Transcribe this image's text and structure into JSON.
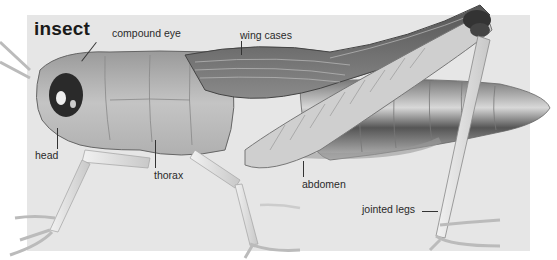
{
  "diagram": {
    "title": "insect",
    "labels": [
      {
        "id": "compound-eye",
        "text": "compound eye"
      },
      {
        "id": "wing-cases",
        "text": "wing cases"
      },
      {
        "id": "head",
        "text": "head"
      },
      {
        "id": "thorax",
        "text": "thorax"
      },
      {
        "id": "abdomen",
        "text": "abdomen"
      },
      {
        "id": "jointed-legs",
        "text": "jointed legs"
      }
    ]
  },
  "colors": {
    "panel": "#e6e6e6",
    "background": "#ffffff",
    "text": "#2a2a2a"
  }
}
